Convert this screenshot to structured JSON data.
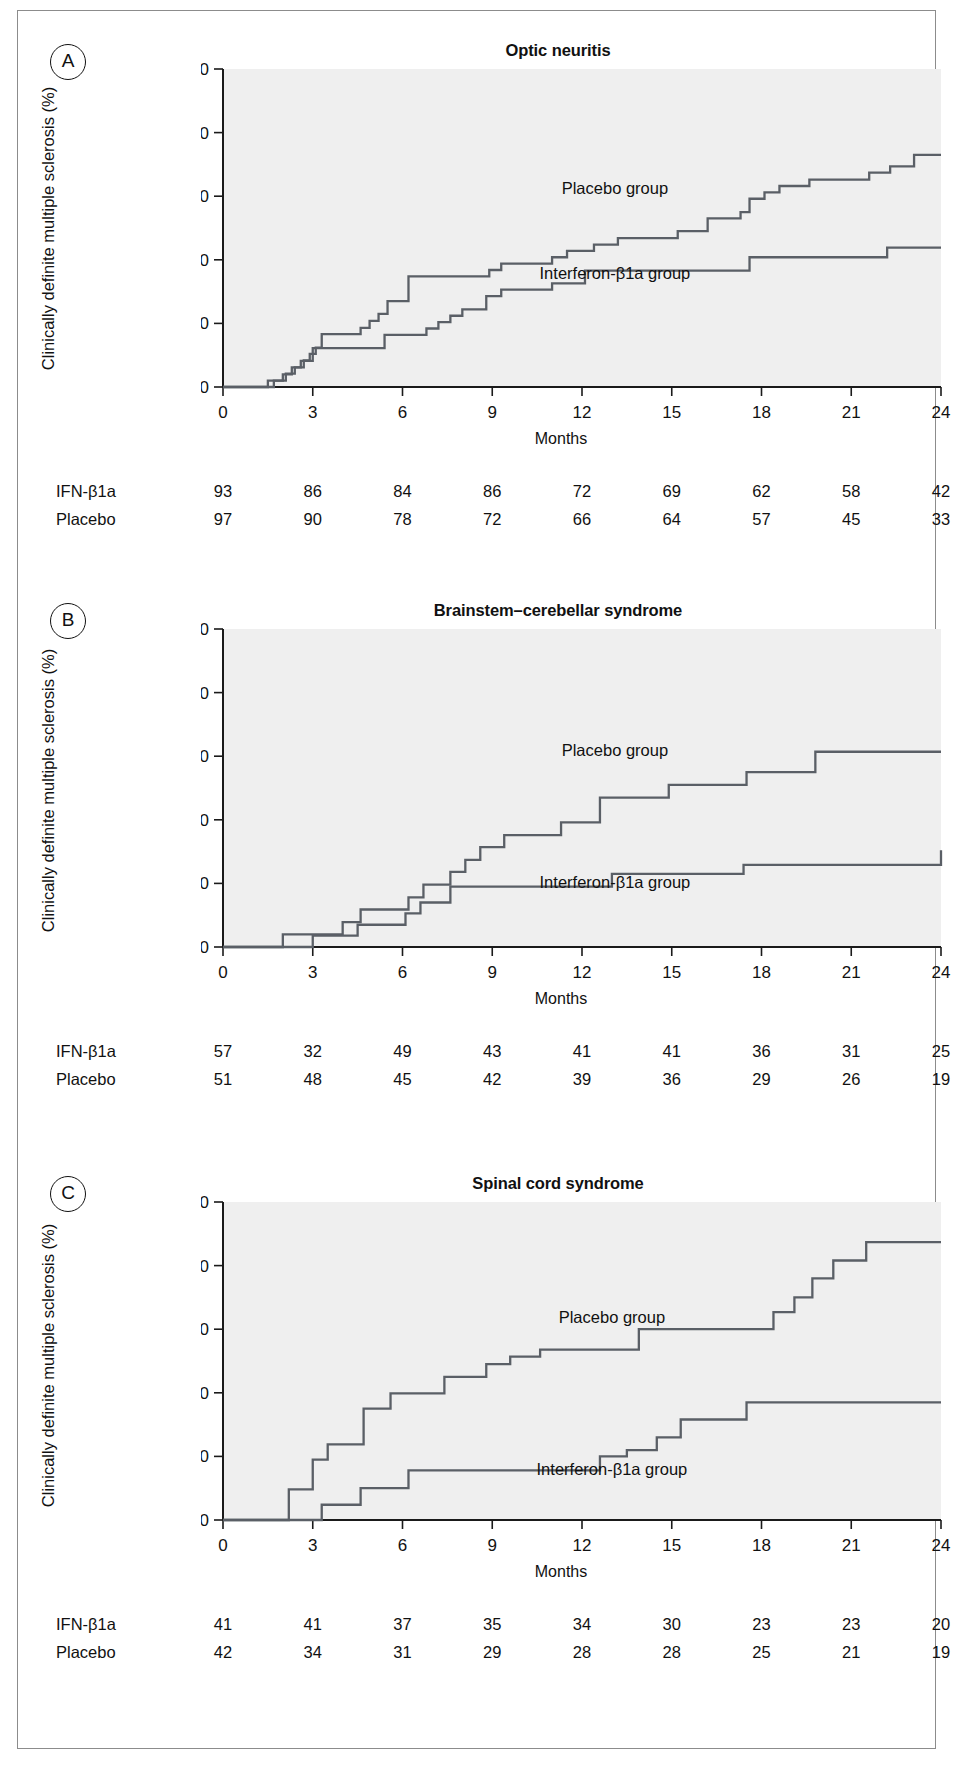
{
  "figure": {
    "background": "#ffffff",
    "plot_background": "#efefef",
    "curve_color": "#5a5f66",
    "axis_color": "#1a1a1a",
    "axis": {
      "y_label": "Clinically definite multiple sclerosis (%)",
      "x_label": "Months",
      "y_ticks": [
        "0",
        "10",
        "20",
        "30",
        "40",
        "50"
      ],
      "x_ticks": [
        "0",
        "3",
        "6",
        "9",
        "12",
        "15",
        "18",
        "21",
        "24"
      ],
      "ylim": [
        0,
        50
      ],
      "xlim": [
        0,
        24
      ]
    },
    "series_labels": {
      "placebo": "Placebo group",
      "interferon": "Interferon-β1a group"
    },
    "risk_row_labels": {
      "interferon": "IFN-β1a",
      "placebo": "Placebo"
    }
  },
  "panels": [
    {
      "letter": "A",
      "title": "Optic neuritis",
      "label_positions": {
        "placebo": {
          "x": 13.1,
          "y": 30.3
        },
        "interferon": {
          "x": 13.1,
          "y": 17.0
        }
      },
      "risk_table": {
        "interferon": [
          "93",
          "86",
          "84",
          "86",
          "72",
          "69",
          "62",
          "58",
          "42"
        ],
        "placebo": [
          "97",
          "90",
          "78",
          "72",
          "66",
          "64",
          "57",
          "45",
          "33"
        ]
      },
      "chart_data": {
        "type": "line",
        "title": "Optic neuritis",
        "xlabel": "Months",
        "ylabel": "Clinically definite multiple sclerosis (%)",
        "xlim": [
          0,
          24
        ],
        "ylim": [
          0,
          50
        ],
        "grid": false,
        "legend": "inline-annotation",
        "series": [
          {
            "name": "Placebo group",
            "x": [
              0,
              1.2,
              1.5,
              1.9,
              2.1,
              2.4,
              2.7,
              2.9,
              3.1,
              3.3,
              4.3,
              4.6,
              4.9,
              5.2,
              5.5,
              6.2,
              8.5,
              8.9,
              9.3,
              10.0,
              11.0,
              11.5,
              12.4,
              13.2,
              14.1,
              15.2,
              16.2,
              17.3,
              17.6,
              18.1,
              18.6,
              19.6,
              20.5,
              21.6,
              22.3,
              23.1,
              24
            ],
            "y": [
              0,
              0,
              1.0,
              1.0,
              2.1,
              3.1,
              4.2,
              5.2,
              6.2,
              8.3,
              8.3,
              9.3,
              10.4,
              11.5,
              13.5,
              17.4,
              17.4,
              18.4,
              19.4,
              19.4,
              20.4,
              21.4,
              22.4,
              23.4,
              23.4,
              24.5,
              26.5,
              27.5,
              29.6,
              30.6,
              31.6,
              32.6,
              32.6,
              33.7,
              34.7,
              36.5,
              36.5
            ]
          },
          {
            "name": "Interferon-β1a group",
            "x": [
              0,
              1.3,
              1.7,
              2.0,
              2.3,
              2.6,
              3.0,
              3.2,
              4.4,
              5.4,
              6.2,
              6.8,
              7.2,
              7.6,
              8.0,
              8.3,
              8.8,
              9.3,
              10.1,
              11.0,
              11.9,
              12.1,
              17.3,
              17.6,
              21.5,
              22.2,
              23.0,
              24
            ],
            "y": [
              0,
              0,
              1.0,
              2.0,
              3.1,
              4.1,
              6.1,
              6.1,
              6.1,
              8.2,
              8.2,
              9.2,
              10.2,
              11.2,
              12.2,
              12.2,
              14.3,
              15.3,
              15.3,
              16.3,
              16.3,
              18.3,
              18.3,
              20.4,
              20.4,
              21.9,
              21.9,
              21.9
            ]
          }
        ]
      }
    },
    {
      "letter": "B",
      "title": "Brainstem–cerebellar syndrome",
      "label_positions": {
        "placebo": {
          "x": 13.1,
          "y": 30.0
        },
        "interferon": {
          "x": 13.1,
          "y": 9.3
        }
      },
      "risk_table": {
        "interferon": [
          "57",
          "32",
          "49",
          "43",
          "41",
          "41",
          "36",
          "31",
          "25"
        ],
        "placebo": [
          "51",
          "48",
          "45",
          "42",
          "39",
          "36",
          "29",
          "26",
          "19"
        ]
      },
      "chart_data": {
        "type": "line",
        "title": "Brainstem–cerebellar syndrome",
        "xlabel": "Months",
        "ylabel": "Clinically definite multiple sclerosis (%)",
        "xlim": [
          0,
          24
        ],
        "ylim": [
          0,
          50
        ],
        "grid": false,
        "legend": "inline-annotation",
        "series": [
          {
            "name": "Placebo group",
            "x": [
              0,
              2.0,
              3.2,
              4.0,
              4.6,
              5.3,
              6.2,
              6.7,
              7.2,
              7.6,
              8.1,
              8.6,
              9.4,
              10.2,
              11.3,
              12.6,
              13.3,
              14.9,
              15.5,
              17.5,
              19.8,
              24
            ],
            "y": [
              0,
              2.0,
              2.0,
              3.9,
              5.9,
              5.9,
              7.8,
              9.8,
              9.8,
              11.8,
              13.7,
              15.7,
              17.6,
              17.6,
              19.6,
              23.5,
              23.5,
              25.5,
              25.5,
              27.5,
              30.7,
              30.7
            ]
          },
          {
            "name": "Interferon-β1a group",
            "x": [
              0,
              2.4,
              3.0,
              3.7,
              4.5,
              5.3,
              6.1,
              6.6,
              7.2,
              7.6,
              11.0,
              13.0,
              15.1,
              17.4,
              24
            ],
            "y": [
              0,
              0,
              1.8,
              1.8,
              3.5,
              3.5,
              5.3,
              7.0,
              7.0,
              9.5,
              9.5,
              11.5,
              11.5,
              12.9,
              15.2
            ]
          }
        ]
      }
    },
    {
      "letter": "C",
      "title": "Spinal cord syndrome",
      "label_positions": {
        "placebo": {
          "x": 13.0,
          "y": 31.0
        },
        "interferon": {
          "x": 13.0,
          "y": 7.0
        }
      },
      "risk_table": {
        "interferon": [
          "41",
          "41",
          "37",
          "35",
          "34",
          "30",
          "23",
          "23",
          "20"
        ],
        "placebo": [
          "42",
          "34",
          "31",
          "29",
          "28",
          "28",
          "25",
          "21",
          "19"
        ]
      },
      "chart_data": {
        "type": "line",
        "title": "Spinal cord syndrome",
        "xlabel": "Months",
        "ylabel": "Clinically definite multiple sclerosis (%)",
        "xlim": [
          0,
          24
        ],
        "ylim": [
          0,
          50
        ],
        "grid": false,
        "legend": "inline-annotation",
        "series": [
          {
            "name": "Placebo group",
            "x": [
              0,
              1.2,
              2.2,
              2.6,
              3.0,
              3.5,
              4.2,
              4.7,
              5.6,
              6.4,
              7.4,
              8.1,
              8.8,
              9.6,
              10.6,
              12.1,
              13.9,
              17.7,
              18.4,
              19.1,
              19.7,
              20.4,
              21.5,
              24
            ],
            "y": [
              0,
              0,
              4.8,
              4.8,
              9.5,
              11.9,
              11.9,
              17.5,
              19.9,
              19.9,
              22.5,
              22.5,
              24.5,
              25.7,
              26.8,
              26.8,
              30.0,
              30.0,
              32.7,
              35.0,
              38.0,
              40.8,
              43.7,
              43.7
            ]
          },
          {
            "name": "Interferon-β1a group",
            "x": [
              0,
              2.9,
              3.3,
              4.1,
              4.6,
              6.2,
              12.0,
              12.6,
              13.5,
              14.5,
              15.3,
              17.0,
              17.5,
              24
            ],
            "y": [
              0,
              0,
              2.4,
              2.4,
              5.0,
              7.8,
              7.8,
              10.0,
              11.0,
              13.0,
              15.8,
              15.8,
              18.5,
              18.5
            ]
          }
        ]
      }
    }
  ]
}
